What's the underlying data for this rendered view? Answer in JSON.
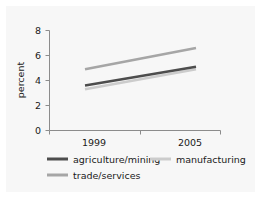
{
  "chart_data": {
    "type": "line",
    "title": "",
    "xlabel": "",
    "ylabel": "percent",
    "x": [
      1999,
      2005
    ],
    "xticklabels": [
      "1999",
      "2005"
    ],
    "yticks": [
      0,
      2,
      4,
      6,
      8
    ],
    "yticklabels": [
      "0",
      "2",
      "4",
      "6",
      "8"
    ],
    "ylim": [
      0,
      8
    ],
    "xlim": [
      1998.2,
      2006.0
    ],
    "grid": false,
    "legend_position": "below",
    "series": [
      {
        "name": "agriculture/mining",
        "color": "#4d4d4d",
        "values": [
          3.6,
          5.1
        ]
      },
      {
        "name": "manufacturing",
        "color": "#cccccc",
        "values": [
          3.3,
          4.9
        ]
      },
      {
        "name": "trade/services",
        "color": "#a6a6a6",
        "values": [
          4.9,
          6.6
        ]
      }
    ]
  },
  "axis": {
    "ylabel": "percent",
    "yticklabels": [
      "8",
      "6",
      "4",
      "2",
      "0"
    ],
    "xticklabels": [
      "1999",
      "2005"
    ]
  },
  "legend": {
    "items": [
      {
        "label": "agriculture/mining",
        "color": "#4d4d4d"
      },
      {
        "label": "manufacturing",
        "color": "#cccccc"
      },
      {
        "label": "trade/services",
        "color": "#a6a6a6"
      }
    ]
  },
  "colors": {
    "panel_background": "#f7f7f7",
    "figure_background": "#ffffff",
    "axis_line": "#8c8c8c",
    "text": "#1a1a1a"
  }
}
